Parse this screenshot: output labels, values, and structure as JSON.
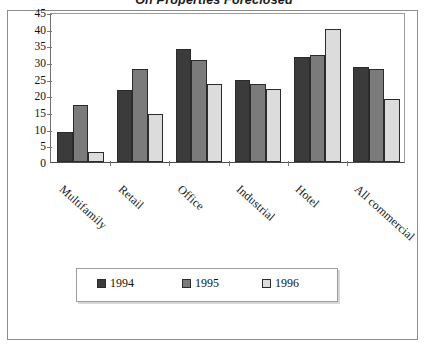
{
  "chart_data": {
    "type": "bar",
    "title": "On Properties Foreclosed",
    "xlabel": "",
    "ylabel": "",
    "ylim": [
      0,
      45
    ],
    "ytick_step": 5,
    "yticks": [
      "45",
      "40",
      "35",
      "30",
      "25",
      "20",
      "15",
      "10",
      "5",
      "0"
    ],
    "grid": false,
    "legend_position": "bottom",
    "categories": [
      "Multifamily",
      "Retail",
      "Office",
      "Industrial",
      "Hotel",
      "All commercial"
    ],
    "series": [
      {
        "name": "1994",
        "color": "#3b3b3b",
        "values": [
          9,
          21.5,
          34,
          24.5,
          31.5,
          28.5
        ]
      },
      {
        "name": "1995",
        "color": "#7b7b7b",
        "values": [
          17,
          28,
          30.5,
          23.5,
          32,
          28
        ]
      },
      {
        "name": "1996",
        "color": "#dcdcdc",
        "values": [
          3,
          14.5,
          23.5,
          22,
          40,
          19
        ]
      }
    ]
  },
  "legend": {
    "items": [
      {
        "label": "1994",
        "color": "#3b3b3b"
      },
      {
        "label": "1995",
        "color": "#7b7b7b"
      },
      {
        "label": "1996",
        "color": "#dcdcdc"
      }
    ]
  }
}
